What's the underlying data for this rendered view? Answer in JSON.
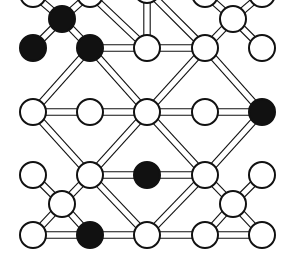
{
  "diagram": {
    "colors": {
      "background": "#ffffff",
      "stroke": "#111111",
      "filled": "#111111",
      "empty": "#ffffff"
    },
    "radius": 13,
    "nodes": [
      {
        "id": "t1",
        "x": 33,
        "y": -6,
        "filled": false
      },
      {
        "id": "t2",
        "x": 90,
        "y": -6,
        "filled": false
      },
      {
        "id": "t3",
        "x": 147,
        "y": -10,
        "filled": false
      },
      {
        "id": "t4",
        "x": 205,
        "y": -6,
        "filled": false
      },
      {
        "id": "t5",
        "x": 262,
        "y": -6,
        "filled": false
      },
      {
        "id": "a1",
        "x": 62,
        "y": 19,
        "filled": true
      },
      {
        "id": "a2",
        "x": 233,
        "y": 19,
        "filled": false
      },
      {
        "id": "b1",
        "x": 33,
        "y": 48,
        "filled": true
      },
      {
        "id": "b2",
        "x": 90,
        "y": 48,
        "filled": true
      },
      {
        "id": "b3",
        "x": 147,
        "y": 48,
        "filled": false
      },
      {
        "id": "b4",
        "x": 205,
        "y": 48,
        "filled": false
      },
      {
        "id": "b5",
        "x": 262,
        "y": 48,
        "filled": false
      },
      {
        "id": "c1",
        "x": 33,
        "y": 112,
        "filled": false
      },
      {
        "id": "c2",
        "x": 90,
        "y": 112,
        "filled": false
      },
      {
        "id": "c3",
        "x": 147,
        "y": 112,
        "filled": false
      },
      {
        "id": "c4",
        "x": 205,
        "y": 112,
        "filled": false
      },
      {
        "id": "c5",
        "x": 262,
        "y": 112,
        "filled": true
      },
      {
        "id": "d1",
        "x": 33,
        "y": 175,
        "filled": false
      },
      {
        "id": "d2",
        "x": 90,
        "y": 175,
        "filled": false
      },
      {
        "id": "d3",
        "x": 147,
        "y": 175,
        "filled": true
      },
      {
        "id": "d4",
        "x": 205,
        "y": 175,
        "filled": false
      },
      {
        "id": "d5",
        "x": 262,
        "y": 175,
        "filled": false
      },
      {
        "id": "e1",
        "x": 62,
        "y": 204,
        "filled": false
      },
      {
        "id": "e2",
        "x": 233,
        "y": 204,
        "filled": false
      },
      {
        "id": "f1",
        "x": 33,
        "y": 235,
        "filled": false
      },
      {
        "id": "f2",
        "x": 90,
        "y": 235,
        "filled": true
      },
      {
        "id": "f3",
        "x": 147,
        "y": 235,
        "filled": false
      },
      {
        "id": "f4",
        "x": 205,
        "y": 235,
        "filled": false
      },
      {
        "id": "f5",
        "x": 262,
        "y": 235,
        "filled": false
      }
    ],
    "bonds": [
      [
        "t1",
        "a1"
      ],
      [
        "t2",
        "a1"
      ],
      [
        "t4",
        "a2"
      ],
      [
        "t5",
        "a2"
      ],
      [
        "t2",
        "b3"
      ],
      [
        "t3",
        "b3"
      ],
      [
        "t3",
        "b4"
      ],
      [
        "a1",
        "b1"
      ],
      [
        "a1",
        "b2"
      ],
      [
        "a2",
        "b4"
      ],
      [
        "a2",
        "b5"
      ],
      [
        "b2",
        "b3"
      ],
      [
        "b3",
        "b4"
      ],
      [
        "b2",
        "c1"
      ],
      [
        "b2",
        "c3"
      ],
      [
        "b4",
        "c3"
      ],
      [
        "b4",
        "c5"
      ],
      [
        "c1",
        "c2"
      ],
      [
        "c2",
        "c3"
      ],
      [
        "c3",
        "c4"
      ],
      [
        "c4",
        "c5"
      ],
      [
        "c1",
        "d2"
      ],
      [
        "c3",
        "d2"
      ],
      [
        "c3",
        "d4"
      ],
      [
        "c5",
        "d4"
      ],
      [
        "d2",
        "d3"
      ],
      [
        "d3",
        "d4"
      ],
      [
        "d1",
        "e1"
      ],
      [
        "d2",
        "e1"
      ],
      [
        "e1",
        "f1"
      ],
      [
        "e1",
        "f2"
      ],
      [
        "d4",
        "e2"
      ],
      [
        "d5",
        "e2"
      ],
      [
        "e2",
        "f4"
      ],
      [
        "e2",
        "f5"
      ],
      [
        "d2",
        "f3"
      ],
      [
        "d4",
        "f3"
      ],
      [
        "f1",
        "f2"
      ],
      [
        "f2",
        "f3"
      ],
      [
        "f3",
        "f4"
      ],
      [
        "f4",
        "f5"
      ]
    ]
  }
}
